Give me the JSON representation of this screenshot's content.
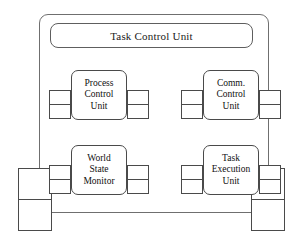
{
  "diagram": {
    "title": "Task Control Unit",
    "frame_name": "task-control-unit-frame",
    "line_color": "#4a4a4a",
    "frame_color": "#6f6f6f",
    "background": "#ffffff",
    "modules": [
      {
        "id": "process-control-unit",
        "lines": [
          "Process",
          "Control",
          "Unit"
        ],
        "position": "top-left",
        "ports": {
          "left": 2,
          "right": 2
        }
      },
      {
        "id": "comm-control-unit",
        "lines": [
          "Comm.",
          "Control",
          "Unit"
        ],
        "position": "top-right",
        "ports": {
          "left": 2,
          "right": 2
        }
      },
      {
        "id": "world-state-monitor",
        "lines": [
          "World",
          "State",
          "Monitor"
        ],
        "position": "bottom-left",
        "ports": {
          "left": 2,
          "right": 2
        }
      },
      {
        "id": "task-execution-unit",
        "lines": [
          "Task",
          "Execution",
          "Unit"
        ],
        "position": "bottom-right",
        "ports": {
          "left": 2,
          "right": 2
        }
      }
    ],
    "external_ports": [
      {
        "id": "external-port-left",
        "side": "left",
        "count": 2
      },
      {
        "id": "external-port-right",
        "side": "right",
        "count": 2
      }
    ]
  }
}
